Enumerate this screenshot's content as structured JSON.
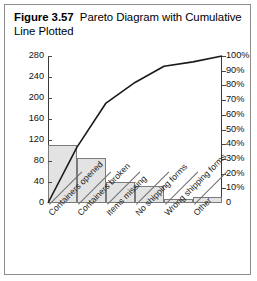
{
  "caption": {
    "number": "Figure 3.57",
    "text": "Pareto Diagram with Cumulative Line Plotted"
  },
  "chart_data": {
    "type": "bar",
    "title": "Pareto Diagram with Cumulative Line Plotted",
    "xlabel": "",
    "ylabel": "",
    "ylim": [
      0,
      280
    ],
    "y2lim": [
      0,
      100
    ],
    "grid": false,
    "legend": "none",
    "categories": [
      "Containers opened",
      "Containers broken",
      "Items missing",
      "No shipping forms",
      "Wrong shipping forms",
      "Other"
    ],
    "series": [
      {
        "name": "Count",
        "type": "bar",
        "axis": "left",
        "values": [
          110,
          85,
          40,
          33,
          8,
          12
        ]
      },
      {
        "name": "Cumulative percent",
        "type": "line",
        "axis": "right",
        "values": [
          38,
          68,
          82,
          93,
          96,
          100
        ]
      }
    ],
    "left_axis_ticks": [
      "0",
      "40",
      "80",
      "120",
      "160",
      "200",
      "240",
      "280"
    ],
    "left_axis_tick_values": [
      0,
      40,
      80,
      120,
      160,
      200,
      240,
      280
    ],
    "right_axis_ticks": [
      "0",
      "10%",
      "20%",
      "30%",
      "40%",
      "50%",
      "60%",
      "70%",
      "80%",
      "90%",
      "100%"
    ],
    "right_axis_tick_values": [
      0,
      10,
      20,
      30,
      40,
      50,
      60,
      70,
      80,
      90,
      100
    ],
    "line_origin_value": 0,
    "bar_fill_color": "#e3e3e3",
    "bar_border_color": "#7b7b7b",
    "line_color": "#1a1a1a"
  }
}
